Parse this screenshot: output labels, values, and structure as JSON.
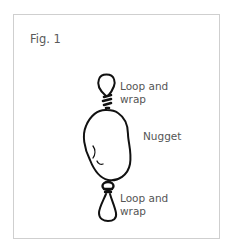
{
  "figure": {
    "title": "Fig. 1",
    "labels": {
      "top_loop": "Loop and\nwrap",
      "nugget": "Nugget",
      "bottom_loop": "Loop and\nwrap"
    },
    "colors": {
      "frame_border": "#cfcfcf",
      "ink": "#111111",
      "text": "#555555"
    }
  }
}
